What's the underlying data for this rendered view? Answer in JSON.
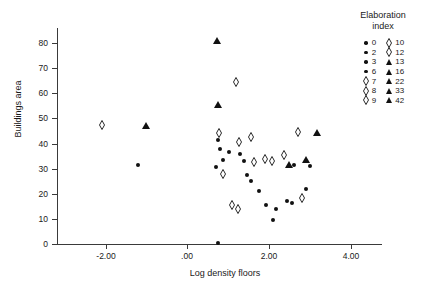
{
  "chart_data": {
    "type": "scatter",
    "title": "",
    "xlabel": "Log density floors",
    "ylabel": "Buildings area",
    "xlim": [
      -3.2,
      4.6
    ],
    "ylim": [
      0,
      86
    ],
    "xticks": [
      "-2.00",
      ".00",
      "2.00",
      "4.00"
    ],
    "xtick_values": [
      -2,
      0,
      2,
      4
    ],
    "yticks": [
      "0",
      "10",
      "20",
      "30",
      "40",
      "50",
      "60",
      "70",
      "80"
    ],
    "ytick_values": [
      0,
      10,
      20,
      30,
      40,
      50,
      60,
      70,
      80
    ],
    "grid": false,
    "legend_position": "top-right",
    "legend_title": "Elaboration index",
    "series": [
      {
        "name": "circle",
        "marker": "filled-circle",
        "points": [
          [
            -1.22,
            31.5
          ],
          [
            0.74,
            0.5
          ],
          [
            0.76,
            41.5
          ],
          [
            0.79,
            38.0
          ],
          [
            0.69,
            30.5
          ],
          [
            0.86,
            33.5
          ],
          [
            1.3,
            36.0
          ],
          [
            1.38,
            33.0
          ],
          [
            1.45,
            27.5
          ],
          [
            1.56,
            25.0
          ],
          [
            1.93,
            15.5
          ],
          [
            2.18,
            14.0
          ],
          [
            2.43,
            17.0
          ],
          [
            2.56,
            16.5
          ],
          [
            2.62,
            31.5
          ],
          [
            3.0,
            31.0
          ],
          [
            1.76,
            21.0
          ],
          [
            2.1,
            9.5
          ],
          [
            1.02,
            36.5
          ],
          [
            2.9,
            22.0
          ]
        ]
      },
      {
        "name": "diamond",
        "marker": "open-diamond",
        "points": [
          [
            -2.1,
            47.5
          ],
          [
            0.78,
            44.0
          ],
          [
            1.18,
            64.5
          ],
          [
            1.26,
            40.5
          ],
          [
            1.55,
            42.5
          ],
          [
            1.9,
            34.0
          ],
          [
            2.08,
            33.0
          ],
          [
            2.36,
            35.5
          ],
          [
            2.72,
            44.5
          ],
          [
            1.62,
            32.5
          ],
          [
            1.1,
            15.5
          ],
          [
            1.24,
            14.0
          ],
          [
            2.8,
            18.5
          ],
          [
            0.88,
            28.0
          ]
        ]
      },
      {
        "name": "triangle",
        "marker": "filled-triangle",
        "points": [
          [
            -1.02,
            47.0
          ],
          [
            0.72,
            81.0
          ],
          [
            0.75,
            55.5
          ],
          [
            2.49,
            31.5
          ],
          [
            3.18,
            44.0
          ],
          [
            2.9,
            33.5
          ]
        ]
      }
    ]
  },
  "legend": {
    "title_line1": "Elaboration",
    "title_line2": "index",
    "columns": [
      {
        "entries": [
          {
            "symbol": "filled-circle",
            "label": "0"
          },
          {
            "symbol": "filled-circle",
            "label": "2"
          },
          {
            "symbol": "filled-circle",
            "label": "3"
          },
          {
            "symbol": "filled-circle",
            "label": "6"
          },
          {
            "symbol": "open-diamond",
            "label": "7"
          },
          {
            "symbol": "open-diamond",
            "label": "8"
          },
          {
            "symbol": "open-diamond",
            "label": "9"
          }
        ]
      },
      {
        "entries": [
          {
            "symbol": "open-diamond",
            "label": "10"
          },
          {
            "symbol": "open-diamond",
            "label": "12"
          },
          {
            "symbol": "filled-triangle",
            "label": "13"
          },
          {
            "symbol": "filled-triangle",
            "label": "16"
          },
          {
            "symbol": "filled-triangle",
            "label": "22"
          },
          {
            "symbol": "filled-triangle",
            "label": "33"
          },
          {
            "symbol": "filled-triangle",
            "label": "42"
          }
        ]
      }
    ]
  },
  "colors": {
    "marker": "#111111",
    "axis": "#3a3a3a",
    "background": "#ffffff"
  }
}
